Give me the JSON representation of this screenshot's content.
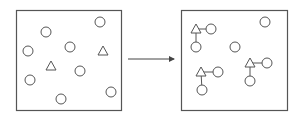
{
  "diagram": {
    "stroke_color": "#555555",
    "left_panel": {
      "box": {
        "x": 16,
        "y": 10,
        "w": 105,
        "h": 100
      },
      "circles": [
        [
          100,
          22
        ],
        [
          46,
          32
        ],
        [
          28,
          51
        ],
        [
          70,
          47
        ],
        [
          30,
          80
        ],
        [
          80,
          71
        ],
        [
          61,
          99
        ],
        [
          111,
          92
        ]
      ],
      "triangles": [
        [
          103,
          51
        ],
        [
          51,
          66
        ]
      ]
    },
    "arrow": {
      "x1": 128,
      "y1": 59,
      "x2": 174,
      "y2": 59
    },
    "right_panel": {
      "box": {
        "x": 181,
        "y": 10,
        "w": 106,
        "h": 100
      },
      "circles": [
        [
          265,
          22
        ],
        [
          235,
          47
        ]
      ],
      "groups": [
        {
          "triangle": [
            196,
            29
          ],
          "circle_right": [
            211,
            29
          ],
          "circle_below": [
            196,
            47
          ]
        },
        {
          "triangle": [
            201,
            72
          ],
          "circle_right": [
            218,
            72
          ],
          "circle_below": [
            202,
            90
          ]
        },
        {
          "triangle": [
            250,
            63
          ],
          "circle_right": [
            267,
            63
          ],
          "circle_below": [
            250,
            81
          ]
        }
      ]
    }
  }
}
